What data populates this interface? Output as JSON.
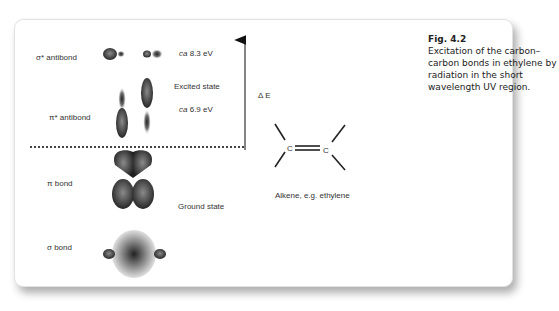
{
  "figure": {
    "number": "Fig. 4.2",
    "caption": "Excitation of the carbon–carbon bonds in ethylene by radiation in the short wavelength UV region."
  },
  "orbitals": {
    "sigma_antibond": {
      "label": "σ* antibond",
      "energy_prefix": "ca",
      "energy": "8.3 eV"
    },
    "pi_antibond": {
      "label": "π* antibond",
      "energy_prefix": "ca",
      "energy": "6.9 eV"
    },
    "pi_bond": {
      "label": "π bond"
    },
    "sigma_bond": {
      "label": "σ bond"
    }
  },
  "states": {
    "excited": "Excited state",
    "ground": "Ground state"
  },
  "energy_axis": {
    "label": "Δ E"
  },
  "molecule": {
    "atom1": "C",
    "atom2": "C",
    "caption": "Alkene, e.g. ethylene"
  },
  "colors": {
    "orbital_dark": "#2a2a2a",
    "orbital_mid": "#7a7a7a",
    "text": "#333333"
  }
}
